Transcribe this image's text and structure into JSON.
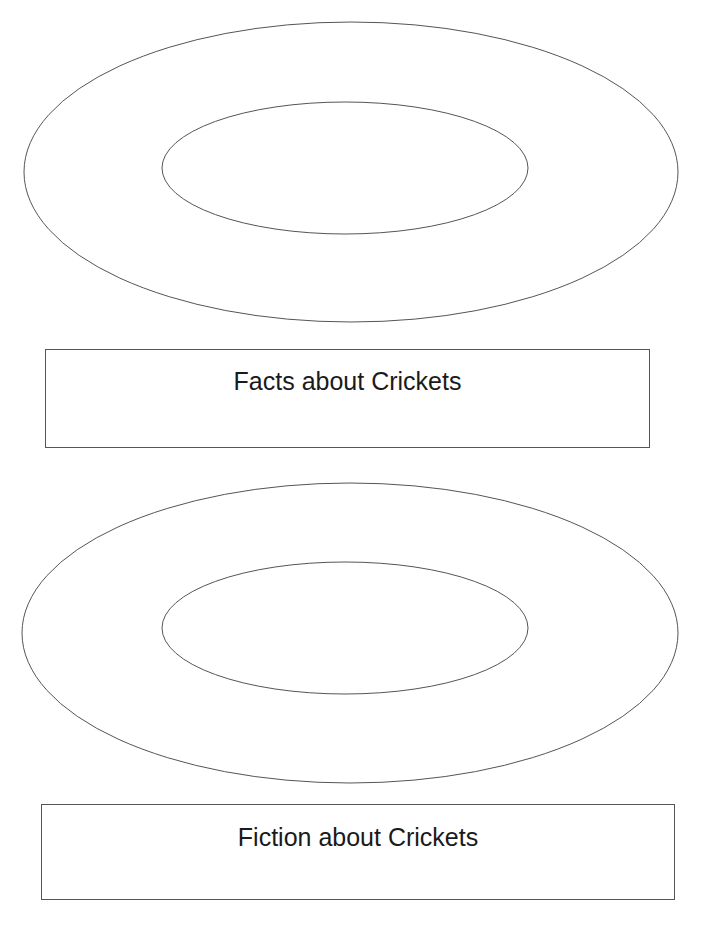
{
  "diagram": {
    "type": "concentric-ring organizer",
    "sections": [
      {
        "id": "facts",
        "label": "Facts about Crickets",
        "outer_ellipse": {
          "cx": 351,
          "cy": 172,
          "rx": 327,
          "ry": 150
        },
        "inner_ellipse": {
          "cx": 345,
          "cy": 168,
          "rx": 183,
          "ry": 66
        }
      },
      {
        "id": "fiction",
        "label": "Fiction about Crickets",
        "outer_ellipse": {
          "cx": 350,
          "cy": 633,
          "rx": 328,
          "ry": 150
        },
        "inner_ellipse": {
          "cx": 345,
          "cy": 628,
          "rx": 183,
          "ry": 66
        }
      }
    ],
    "stroke_color": "#555555",
    "background": "#ffffff"
  }
}
